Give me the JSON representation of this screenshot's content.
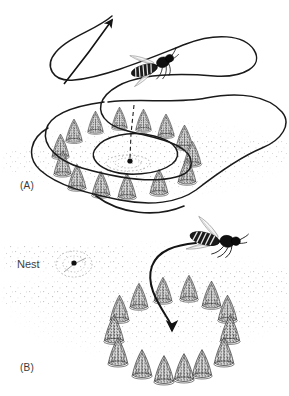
{
  "figure": {
    "background_color": "#ffffff",
    "ink_color": "#1a1a1a",
    "ground_speckle_color": "#b9b9b9",
    "cone_color": "#2b2b2b",
    "width": 289,
    "height": 396
  },
  "panels": [
    {
      "id": "A",
      "label": "(A)",
      "caption_text": "(A)",
      "label_position": {
        "x": 20,
        "y": 180
      },
      "description": "Wasp performs looping orientation flight above nest ringed by pine cones",
      "flight_path": {
        "type": "looping-orientation-flight",
        "stroke_width": 1.6,
        "arrowhead": {
          "x": 110,
          "y": 13,
          "direction": "up-right"
        },
        "loop_count": 4
      },
      "insect": {
        "name": "wasp",
        "x": 143,
        "y": 82,
        "rotation": -18,
        "body_length": 46,
        "facing": "right"
      },
      "nest_marker": {
        "x": 130,
        "y": 163,
        "visible": true,
        "radius": 2.6
      },
      "sight_line": {
        "from": {
          "x": 134,
          "y": 104
        },
        "to": {
          "x": 130,
          "y": 161
        },
        "style": "dashed"
      },
      "cone_ring": {
        "center_x": 128,
        "center_y": 152,
        "radius_x": 68,
        "radius_y": 33,
        "count": 14,
        "cone_height": 28,
        "cone_width": 22
      }
    },
    {
      "id": "B",
      "label": "(B)",
      "caption_text": "(B)",
      "label_position": {
        "x": 20,
        "y": 362
      },
      "description": "Returning wasp searches the displaced pine cone ring centre, not the real nest",
      "flight_path": {
        "type": "return-approach",
        "stroke_width": 2.0,
        "arrowhead": {
          "x": 172,
          "y": 332,
          "direction": "down"
        }
      },
      "insect": {
        "name": "wasp",
        "x": 213,
        "y": 235,
        "rotation": 14,
        "body_length": 52,
        "facing": "right"
      },
      "nest_marker": {
        "x": 74,
        "y": 264,
        "visible": true,
        "radius": 2.6
      },
      "nest_label": {
        "text": "Nest",
        "x": 17,
        "y": 258
      },
      "cone_ring": {
        "center_x": 170,
        "center_y": 330,
        "radius_x": 62,
        "radius_y": 38,
        "count": 14,
        "cone_height": 30,
        "cone_width": 23
      }
    }
  ],
  "labels": {
    "panel_a": "(A)",
    "panel_b": "(B)",
    "nest": "Nest"
  }
}
